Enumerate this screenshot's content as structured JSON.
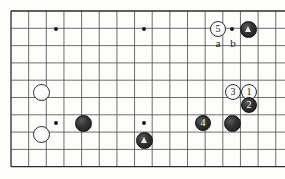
{
  "figure": {
    "kind": "go-board-diagram",
    "width": 285,
    "height": 179,
    "background_color": "#fdfdfb",
    "line_color": "#4a4a4a",
    "border_color": "#2a2a2a"
  },
  "board": {
    "origin_x": 11,
    "origin_y": 11,
    "col_spacing": 17.65,
    "row_spacing": 17.3,
    "cols": 16,
    "rows": 9,
    "star_points": [
      {
        "col": 2.55,
        "row": 1.04
      },
      {
        "col": 7.54,
        "row": 1.04
      },
      {
        "col": 12.52,
        "row": 1.04
      },
      {
        "col": 2.55,
        "row": 6.47
      },
      {
        "col": 7.54,
        "row": 6.47
      }
    ]
  },
  "stones": [
    {
      "id": "w5",
      "color": "white",
      "label": "5",
      "marker": "none",
      "x": 218,
      "y": 29,
      "d": 16
    },
    {
      "id": "b-t1",
      "color": "black",
      "label": "",
      "marker": "triangle",
      "x": 248,
      "y": 29,
      "d": 17
    },
    {
      "id": "w-a",
      "color": "white",
      "label": "",
      "marker": "none",
      "x": 41,
      "y": 92,
      "d": 17
    },
    {
      "id": "w3",
      "color": "white",
      "label": "3",
      "marker": "none",
      "x": 233,
      "y": 92,
      "d": 16
    },
    {
      "id": "w1",
      "color": "white",
      "label": "1",
      "marker": "none",
      "x": 249,
      "y": 92,
      "d": 16
    },
    {
      "id": "b2",
      "color": "black",
      "label": "2",
      "marker": "none",
      "x": 249,
      "y": 105,
      "d": 16
    },
    {
      "id": "w-b",
      "color": "white",
      "label": "",
      "marker": "none",
      "x": 41,
      "y": 134,
      "d": 17
    },
    {
      "id": "b-c",
      "color": "black",
      "label": "",
      "marker": "none",
      "x": 83,
      "y": 123,
      "d": 17
    },
    {
      "id": "b-t2",
      "color": "black",
      "label": "",
      "marker": "triangle",
      "x": 144,
      "y": 140,
      "d": 17
    },
    {
      "id": "b4",
      "color": "black",
      "label": "4",
      "marker": "none",
      "x": 203,
      "y": 123,
      "d": 16
    },
    {
      "id": "b-d",
      "color": "black",
      "label": "",
      "marker": "none",
      "x": 232,
      "y": 123,
      "d": 17
    }
  ],
  "point_labels": [
    {
      "id": "label-a",
      "text": "a",
      "x": 218,
      "y": 44
    },
    {
      "id": "label-b",
      "text": "b",
      "x": 233,
      "y": 44
    }
  ]
}
